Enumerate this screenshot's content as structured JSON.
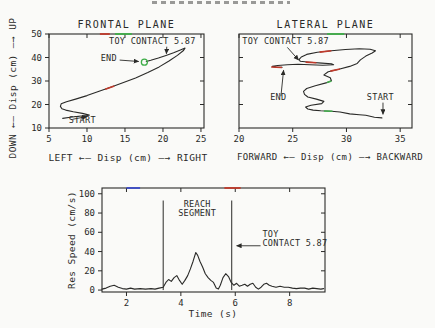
{
  "colors": {
    "ink": "#2a2a28",
    "red": "#c03a2b",
    "green": "#3fae49",
    "blue": "#3b4bc8",
    "bg": "#fafaf8"
  },
  "chart_data": [
    {
      "id": "frontal",
      "type": "line",
      "title": "FRONTAL PLANE",
      "xlabel": "LEFT ←— Disp (cm) —→ RIGHT",
      "ylabel": "DOWN ←— Disp (cm) —→ UP",
      "xdomain": [
        5,
        25.4
      ],
      "ydomain": [
        10,
        50
      ],
      "xticks": [
        5,
        10,
        15,
        20,
        25
      ],
      "yticks_left_labeled": [
        10,
        20,
        30,
        40,
        50
      ],
      "yticks_right_inner": [
        20,
        30,
        40
      ],
      "grid": false,
      "box": {
        "left": 49,
        "top": 34,
        "width": 155,
        "height": 94
      },
      "series": [
        [
          6.8,
          14.1
        ],
        [
          7.8,
          14.6
        ],
        [
          8.9,
          15.0
        ],
        [
          10.0,
          15.3
        ],
        [
          10.3,
          15.5
        ],
        [
          9.4,
          16.2
        ],
        [
          8.2,
          16.9
        ],
        [
          7.2,
          17.6
        ],
        [
          6.7,
          18.2
        ],
        [
          6.5,
          19.2
        ],
        [
          6.6,
          20.3
        ],
        [
          7.3,
          21.2
        ],
        [
          8.5,
          22.3
        ],
        [
          10.0,
          23.8
        ],
        [
          11.6,
          25.6
        ],
        [
          13.2,
          27.5
        ],
        [
          14.8,
          29.4
        ],
        [
          16.4,
          31.3
        ],
        [
          18.0,
          33.6
        ],
        [
          19.5,
          36.0
        ],
        [
          20.8,
          38.5
        ],
        [
          21.9,
          40.9
        ],
        [
          22.7,
          43.0
        ],
        [
          22.9,
          44.0
        ],
        [
          22.3,
          43.2
        ],
        [
          21.4,
          42.0
        ],
        [
          20.4,
          40.9
        ],
        [
          19.4,
          39.8
        ],
        [
          18.4,
          38.8
        ],
        [
          17.8,
          38.3
        ]
      ],
      "overlays": [
        {
          "color": "#c03a2b",
          "points": [
            [
              12.4,
              26.5
            ],
            [
              13.6,
              27.9
            ]
          ]
        }
      ],
      "frame_marks": [
        {
          "edge": "top",
          "from": 11.7,
          "to": 13.0,
          "color": "#c03a2b"
        },
        {
          "edge": "top",
          "from": 13.7,
          "to": 15.9,
          "color": "#3fae49"
        }
      ],
      "marker": {
        "x": 17.55,
        "y": 38.0,
        "r": 3,
        "color": "#3fae49"
      },
      "annotations": [
        {
          "text": "TOY CONTACT 5.87",
          "x": 12.9,
          "y": 45.9,
          "anchor": "start"
        },
        {
          "text": "END",
          "x": 11.8,
          "y": 38.6,
          "anchor": "start"
        },
        {
          "text": "START",
          "x": 7.6,
          "y": 12.2,
          "anchor": "start"
        }
      ],
      "arrows": [
        {
          "x1": 20.5,
          "y1": 44.6,
          "x2": 20.45,
          "y2": 41.6
        },
        {
          "x1": 14.3,
          "y1": 38.9,
          "x2": 16.8,
          "y2": 38.3
        },
        {
          "x1": 8.1,
          "y1": 13.7,
          "x2": 10.0,
          "y2": 14.9
        }
      ]
    },
    {
      "id": "lateral",
      "type": "line",
      "title": "LATERAL PLANE",
      "xlabel": "FORWARD ←— Disp (cm) —→ BACKWARD",
      "ylabel": "",
      "xdomain": [
        20,
        36.1
      ],
      "ydomain": [
        10,
        50
      ],
      "xticks": [
        20,
        25,
        30,
        35
      ],
      "yticks_left_inner": [
        20,
        30,
        40
      ],
      "yticks_right_inner": [
        20,
        30,
        40
      ],
      "grid": false,
      "box": {
        "left": 239,
        "top": 34,
        "width": 173,
        "height": 94
      },
      "series": [
        [
          33.3,
          14.3
        ],
        [
          32.6,
          14.6
        ],
        [
          31.8,
          15.4
        ],
        [
          31.2,
          15.6
        ],
        [
          30.3,
          16.0
        ],
        [
          29.4,
          16.8
        ],
        [
          28.6,
          17.1
        ],
        [
          27.6,
          17.3
        ],
        [
          26.9,
          17.6
        ],
        [
          26.4,
          18.1
        ],
        [
          26.2,
          18.9
        ],
        [
          26.7,
          19.7
        ],
        [
          27.7,
          20.4
        ],
        [
          27.9,
          21.3
        ],
        [
          27.2,
          22.3
        ],
        [
          26.4,
          23.2
        ],
        [
          26.1,
          24.3
        ],
        [
          26.0,
          25.6
        ],
        [
          26.3,
          26.8
        ],
        [
          27.1,
          28.0
        ],
        [
          28.1,
          29.2
        ],
        [
          28.6,
          30.1
        ],
        [
          28.5,
          31.4
        ],
        [
          27.9,
          32.6
        ],
        [
          28.3,
          33.9
        ],
        [
          29.3,
          35.0
        ],
        [
          30.3,
          36.2
        ],
        [
          31.0,
          37.5
        ],
        [
          31.3,
          39.0
        ],
        [
          31.8,
          40.6
        ],
        [
          32.4,
          41.9
        ],
        [
          32.7,
          42.9
        ],
        [
          32.2,
          43.5
        ],
        [
          31.2,
          43.7
        ],
        [
          29.9,
          43.4
        ],
        [
          28.6,
          42.9
        ],
        [
          27.3,
          42.2
        ],
        [
          26.3,
          41.3
        ],
        [
          25.8,
          40.2
        ],
        [
          25.6,
          39.2
        ],
        [
          25.7,
          38.4
        ],
        [
          26.6,
          38.0
        ],
        [
          27.7,
          37.6
        ],
        [
          28.6,
          37.3
        ],
        [
          28.8,
          36.9
        ],
        [
          27.8,
          36.7
        ],
        [
          26.6,
          36.9
        ],
        [
          25.5,
          37.1
        ],
        [
          24.5,
          36.9
        ],
        [
          23.6,
          36.6
        ],
        [
          23.1,
          36.2
        ],
        [
          23.4,
          35.9
        ],
        [
          24.0,
          35.8
        ]
      ],
      "overlays": [
        {
          "color": "#c03a2b",
          "points": [
            [
              23.0,
              35.95
            ],
            [
              24.0,
              35.75
            ]
          ]
        },
        {
          "color": "#c03a2b",
          "points": [
            [
              28.5,
              34.2
            ],
            [
              29.4,
              35.1
            ]
          ]
        },
        {
          "color": "#c03a2b",
          "points": [
            [
              26.2,
              38.05
            ],
            [
              27.2,
              37.75
            ]
          ]
        },
        {
          "color": "#c03a2b",
          "points": [
            [
              27.5,
              42.3
            ],
            [
              28.6,
              42.9
            ]
          ]
        },
        {
          "color": "#3fae49",
          "points": [
            [
              27.9,
              17.25
            ],
            [
              28.7,
              17.15
            ]
          ]
        },
        {
          "color": "#3fae49",
          "points": [
            [
              28.2,
              29.4
            ],
            [
              28.6,
              30.0
            ]
          ]
        }
      ],
      "frame_marks": [
        {
          "edge": "top",
          "from": 28.2,
          "to": 29.8,
          "color": "#3fae49"
        }
      ],
      "annotations": [
        {
          "text": "TOY CONTACT 5.87",
          "x": 20.3,
          "y": 45.9,
          "anchor": "start"
        },
        {
          "text": "END",
          "x": 22.9,
          "y": 21.8,
          "anchor": "start"
        },
        {
          "text": "START",
          "x": 31.9,
          "y": 22.0,
          "anchor": "start"
        }
      ],
      "arrows": [
        {
          "x1": 24.5,
          "y1": 44.3,
          "x2": 25.55,
          "y2": 38.9
        },
        {
          "x1": 23.9,
          "y1": 23.5,
          "x2": 24.15,
          "y2": 34.6
        },
        {
          "x1": 33.4,
          "y1": 20.8,
          "x2": 33.4,
          "y2": 15.8
        }
      ]
    },
    {
      "id": "speed",
      "type": "line",
      "title": "",
      "xlabel": "Time (s)",
      "ylabel": "Res Speed (cm/s)",
      "xdomain": [
        1.1,
        9.3
      ],
      "ydomain": [
        -2,
        106
      ],
      "xticks": [
        2,
        4,
        6,
        8
      ],
      "yticks_left_labeled": [
        0,
        20,
        40,
        60,
        80,
        100
      ],
      "yticks_right_inner": [
        20,
        40,
        60,
        80,
        100
      ],
      "grid": false,
      "box": {
        "left": 102,
        "top": 188,
        "width": 223,
        "height": 104
      },
      "series": [
        [
          1.1,
          1
        ],
        [
          1.25,
          2
        ],
        [
          1.4,
          4
        ],
        [
          1.55,
          5
        ],
        [
          1.7,
          3
        ],
        [
          1.85,
          1.5
        ],
        [
          2.0,
          1
        ],
        [
          2.15,
          2
        ],
        [
          2.3,
          1
        ],
        [
          2.5,
          1.5
        ],
        [
          2.7,
          1
        ],
        [
          2.9,
          1.5
        ],
        [
          3.05,
          1
        ],
        [
          3.2,
          2
        ],
        [
          3.35,
          3
        ],
        [
          3.45,
          8
        ],
        [
          3.55,
          11
        ],
        [
          3.65,
          9
        ],
        [
          3.75,
          13
        ],
        [
          3.85,
          15
        ],
        [
          3.95,
          10
        ],
        [
          4.05,
          6
        ],
        [
          4.15,
          10
        ],
        [
          4.25,
          15
        ],
        [
          4.35,
          22
        ],
        [
          4.45,
          30
        ],
        [
          4.55,
          39
        ],
        [
          4.62,
          36
        ],
        [
          4.7,
          30
        ],
        [
          4.8,
          24
        ],
        [
          4.9,
          17
        ],
        [
          5.0,
          13
        ],
        [
          5.1,
          10
        ],
        [
          5.2,
          8
        ],
        [
          5.3,
          2
        ],
        [
          5.38,
          1
        ],
        [
          5.45,
          5
        ],
        [
          5.55,
          13
        ],
        [
          5.65,
          17
        ],
        [
          5.75,
          14
        ],
        [
          5.85,
          8
        ],
        [
          5.95,
          5
        ],
        [
          6.05,
          7
        ],
        [
          6.15,
          4
        ],
        [
          6.25,
          5
        ],
        [
          6.35,
          6
        ],
        [
          6.45,
          4
        ],
        [
          6.55,
          6
        ],
        [
          6.65,
          7
        ],
        [
          6.75,
          3
        ],
        [
          6.85,
          1
        ],
        [
          6.95,
          3
        ],
        [
          7.05,
          6
        ],
        [
          7.15,
          7
        ],
        [
          7.25,
          5
        ],
        [
          7.35,
          4
        ],
        [
          7.5,
          3
        ],
        [
          7.65,
          4
        ],
        [
          7.8,
          3
        ],
        [
          7.95,
          3
        ],
        [
          8.1,
          2
        ],
        [
          8.25,
          1.5
        ],
        [
          8.4,
          2
        ],
        [
          8.55,
          2
        ],
        [
          8.7,
          1
        ],
        [
          8.85,
          2
        ],
        [
          9.0,
          1.5
        ],
        [
          9.15,
          1
        ],
        [
          9.25,
          1.5
        ]
      ],
      "vlines": [
        {
          "x": 3.35,
          "y1": 0,
          "y2": 93
        },
        {
          "x": 5.87,
          "y1": 0,
          "y2": 93
        }
      ],
      "frame_marks": [
        {
          "edge": "top",
          "from": 2.0,
          "to": 2.5,
          "color": "#3b4bc8"
        },
        {
          "edge": "top",
          "from": 5.6,
          "to": 6.2,
          "color": "#c03a2b"
        }
      ],
      "annotations": [
        {
          "lines": [
            "REACH",
            "SEGMENT"
          ],
          "x": 4.6,
          "y": 86,
          "anchor": "middle"
        },
        {
          "lines": [
            "TOY",
            "CONTACT 5.87"
          ],
          "x": 7.0,
          "y": 55,
          "anchor": "start"
        }
      ],
      "arrows": [
        {
          "x1": 6.93,
          "y1": 46,
          "x2": 6.05,
          "y2": 46
        }
      ]
    }
  ]
}
